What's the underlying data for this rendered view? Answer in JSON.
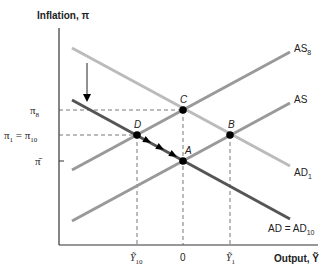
{
  "diagram": {
    "title_y_axis": "Inflation, π",
    "title_x_axis": "Output, Ỹ",
    "colors": {
      "axis": "#333333",
      "ad": "#555555",
      "ad1": "#bbbbbb",
      "as": "#999999",
      "dash": "#555555",
      "point": "#000000"
    },
    "y_ticks": [
      {
        "label": "π",
        "sub": "8",
        "y": 110
      },
      {
        "label": "π",
        "sub": "1",
        "eq": " = π",
        "sub2": "10",
        "y": 135
      },
      {
        "label": "π̄",
        "y": 161
      }
    ],
    "x_ticks": [
      {
        "label": "Ỹ",
        "sub": "10",
        "x": 137
      },
      {
        "label": "0",
        "x": 183
      },
      {
        "label": "Ỹ",
        "sub": "1",
        "x": 231
      }
    ],
    "curves": [
      {
        "name": "AS8",
        "label": "AS",
        "sub": "8",
        "from": [
          72,
          170
        ],
        "to": [
          290,
          52
        ]
      },
      {
        "name": "AS",
        "label": "AS",
        "from": [
          72,
          221
        ],
        "to": [
          290,
          103
        ]
      },
      {
        "name": "AD1",
        "label": "AD",
        "sub": "1",
        "from": [
          72,
          48
        ],
        "to": [
          290,
          166
        ]
      },
      {
        "name": "AD",
        "label": "AD = AD",
        "sub": "10",
        "from": [
          72,
          100
        ],
        "to": [
          290,
          219
        ]
      }
    ],
    "points": [
      {
        "label": "A",
        "x": 183,
        "y": 161
      },
      {
        "label": "B",
        "x": 230,
        "y": 135
      },
      {
        "label": "C",
        "x": 183,
        "y": 110
      },
      {
        "label": "D",
        "x": 137,
        "y": 135
      }
    ],
    "shift_arrow": {
      "x": 87,
      "y1": 63,
      "y2": 100
    },
    "path_arrows": [
      [
        148,
        141
      ],
      [
        161,
        148
      ],
      [
        174,
        155
      ]
    ]
  }
}
